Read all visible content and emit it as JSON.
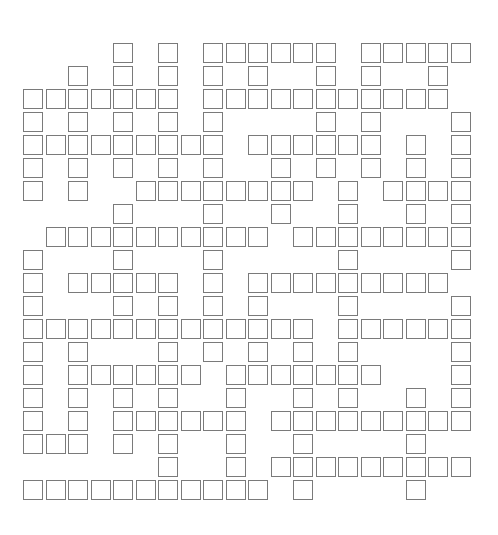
{
  "puzzle": {
    "type": "crossword",
    "grid_columns": 20,
    "grid_rows": 20,
    "origin_x": 23,
    "origin_y": 43,
    "pitch_x": 22.5,
    "pitch_y": 23,
    "colors": {
      "cell_border": "#7a7a7a",
      "cell_fill": "#ffffff",
      "background": "#ffffff"
    },
    "rows": [
      {
        "row": 0,
        "cols": [
          4,
          6,
          8,
          9,
          10,
          11,
          12,
          13,
          15,
          16,
          17,
          18,
          19
        ]
      },
      {
        "row": 1,
        "cols": [
          2,
          4,
          6,
          8,
          10,
          13,
          15,
          18
        ]
      },
      {
        "row": 2,
        "cols": [
          0,
          1,
          2,
          3,
          4,
          5,
          6,
          8,
          9,
          10,
          11,
          12,
          13,
          14,
          15,
          16,
          17,
          18
        ]
      },
      {
        "row": 3,
        "cols": [
          0,
          2,
          4,
          6,
          8,
          13,
          15,
          19
        ]
      },
      {
        "row": 4,
        "cols": [
          0,
          1,
          2,
          3,
          4,
          5,
          6,
          7,
          8,
          10,
          11,
          12,
          13,
          14,
          15,
          17,
          19
        ]
      },
      {
        "row": 5,
        "cols": [
          0,
          2,
          4,
          6,
          8,
          11,
          13,
          15,
          17,
          19
        ]
      },
      {
        "row": 6,
        "cols": [
          0,
          2,
          5,
          6,
          7,
          8,
          9,
          10,
          11,
          12,
          14,
          16,
          17,
          18,
          19
        ]
      },
      {
        "row": 7,
        "cols": [
          4,
          8,
          11,
          14,
          17,
          19
        ]
      },
      {
        "row": 8,
        "cols": [
          1,
          2,
          3,
          4,
          5,
          6,
          7,
          8,
          9,
          10,
          12,
          13,
          14,
          15,
          16,
          17,
          18,
          19
        ]
      },
      {
        "row": 9,
        "cols": [
          0,
          4,
          8,
          14,
          19
        ]
      },
      {
        "row": 10,
        "cols": [
          0,
          2,
          3,
          4,
          5,
          6,
          8,
          10,
          11,
          12,
          13,
          14,
          15,
          16,
          17,
          18
        ]
      },
      {
        "row": 11,
        "cols": [
          0,
          4,
          6,
          8,
          10,
          14,
          19
        ]
      },
      {
        "row": 12,
        "cols": [
          0,
          1,
          2,
          3,
          4,
          5,
          6,
          7,
          8,
          9,
          10,
          11,
          12,
          14,
          15,
          16,
          17,
          18,
          19
        ]
      },
      {
        "row": 13,
        "cols": [
          0,
          2,
          6,
          8,
          10,
          12,
          14,
          19
        ]
      },
      {
        "row": 14,
        "cols": [
          0,
          2,
          3,
          4,
          5,
          6,
          7,
          9,
          10,
          11,
          12,
          13,
          14,
          15,
          19
        ]
      },
      {
        "row": 15,
        "cols": [
          0,
          2,
          4,
          6,
          9,
          12,
          14,
          17,
          19
        ]
      },
      {
        "row": 16,
        "cols": [
          0,
          2,
          4,
          5,
          6,
          7,
          8,
          9,
          11,
          12,
          13,
          14,
          15,
          16,
          17,
          18,
          19
        ]
      },
      {
        "row": 17,
        "cols": [
          0,
          1,
          2,
          4,
          6,
          9,
          12,
          17
        ]
      },
      {
        "row": 18,
        "cols": [
          6,
          9,
          11,
          12,
          13,
          14,
          15,
          16,
          17,
          18,
          19
        ]
      },
      {
        "row": 19,
        "cols": [
          0,
          1,
          2,
          3,
          4,
          5,
          6,
          7,
          8,
          9,
          10,
          12,
          17
        ]
      }
    ],
    "cell_values": {}
  }
}
